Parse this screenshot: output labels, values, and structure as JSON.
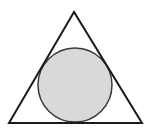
{
  "diagram": {
    "type": "geometry",
    "triangle": {
      "points": [
        [
          74,
          12
        ],
        [
          9,
          123
        ],
        [
          142,
          123
        ]
      ],
      "stroke": "#1a1a1a",
      "fill": "none"
    },
    "circle": {
      "cx": 75,
      "cy": 85,
      "r": 37,
      "stroke": "#3a3a3a",
      "fill": "#d9d9d9"
    }
  }
}
